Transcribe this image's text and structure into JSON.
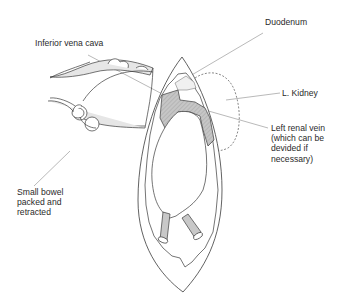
{
  "figure": {
    "type": "surgical-anatomy-illustration",
    "labels": {
      "duodenum": "Duodenum",
      "ivc": "Inferior vena cava",
      "kidney": "L. Kidney",
      "renal_vein": {
        "line1": "Left renal vein",
        "line2": "(which can be",
        "line3": "devided if",
        "line4": "necessary)"
      },
      "small_bowel": {
        "line1": "Small bowel",
        "line2": "packed and",
        "line3": "retracted"
      }
    },
    "colors": {
      "ink": "#3a3a3a",
      "leader": "#8a8a8a",
      "vessel_fill": "#c8c8c8",
      "bowel_fill": "#e6e6e6",
      "background": "#ffffff"
    }
  }
}
